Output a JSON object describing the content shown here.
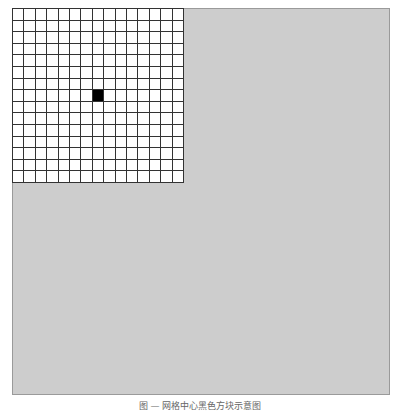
{
  "figure": {
    "background_color": "#cdcdcd",
    "grid": {
      "rows": 15,
      "cols": 15,
      "cell_color": "#ffffff",
      "line_color": "#333333",
      "highlighted_cells": [
        {
          "row": 7,
          "col": 7,
          "color": "#000000"
        }
      ]
    },
    "caption": "图 — 网格中心黑色方块示意图"
  }
}
